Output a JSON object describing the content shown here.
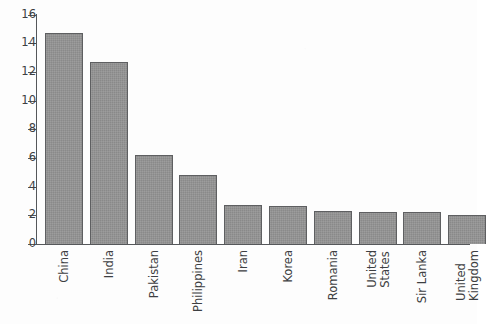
{
  "chart_data": {
    "type": "bar",
    "title": "",
    "subtitle": "",
    "xlabel": "",
    "ylabel": "",
    "categories": [
      "China",
      "India",
      "Pakistan",
      "Philippines",
      "Iran",
      "Korea",
      "Romania",
      "United States",
      "Sir Lanka",
      "United Kingdom"
    ],
    "category_lines": [
      [
        "China"
      ],
      [
        "India"
      ],
      [
        "Pakistan"
      ],
      [
        "Philippines"
      ],
      [
        "Iran"
      ],
      [
        "Korea"
      ],
      [
        "Romania"
      ],
      [
        "United",
        "States"
      ],
      [
        "Sir Lanka"
      ],
      [
        "United",
        "Kingdom"
      ]
    ],
    "values": [
      14.7,
      12.7,
      6.2,
      4.8,
      2.7,
      2.65,
      2.3,
      2.25,
      2.2,
      2.05
    ],
    "ylim": [
      0,
      16
    ],
    "yticks": [
      0,
      2,
      4,
      6,
      8,
      10,
      12,
      14,
      16
    ],
    "ytick_labels": [
      "0",
      "2",
      "4",
      "6",
      "8",
      "10",
      "12",
      "14",
      "16"
    ],
    "grid": false,
    "legend": false,
    "legend_position": "none",
    "bar_fill_color": "#939393",
    "bar_border_color": "#5e5f61",
    "axis_color": "#55575a",
    "text_color": "#3d3f42",
    "background_color": "#fdfdfd",
    "xtick_label_rotation": 90
  }
}
